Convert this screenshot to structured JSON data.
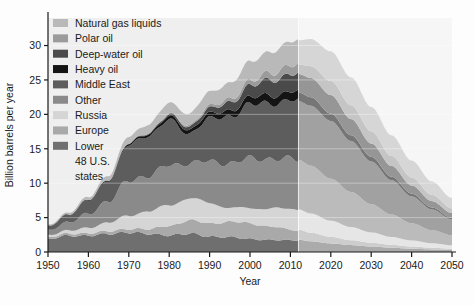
{
  "chart_data": {
    "type": "area",
    "stacked": true,
    "title": "",
    "xlabel": "Year",
    "ylabel": "Billion barrels per year",
    "xlim": [
      1950,
      2050
    ],
    "ylim": [
      0,
      34
    ],
    "xticks": [
      1950,
      1960,
      1970,
      1980,
      1990,
      2000,
      2010,
      2020,
      2030,
      2040,
      2050
    ],
    "yticks": [
      0,
      5,
      10,
      15,
      20,
      25,
      30
    ],
    "grid": "horizontal-light",
    "legend_position": "top-left-inside",
    "projection_start_year": 2012,
    "projection_shading": "#f0f0f0",
    "plot_background": "#efefef",
    "x": [
      1950,
      1955,
      1960,
      1965,
      1970,
      1975,
      1980,
      1985,
      1990,
      1995,
      2000,
      2005,
      2010,
      2012,
      2015,
      2020,
      2025,
      2030,
      2035,
      2040,
      2045,
      2050
    ],
    "series": [
      {
        "name": "Lower 48 U.S. states",
        "color": "#6f6f6f",
        "values": [
          1.95,
          2.3,
          2.45,
          2.55,
          2.95,
          2.55,
          2.5,
          2.6,
          2.3,
          2.1,
          1.95,
          1.7,
          1.75,
          1.8,
          1.55,
          1.25,
          1.0,
          0.8,
          0.62,
          0.48,
          0.38,
          0.3
        ]
      },
      {
        "name": "Europe",
        "color": "#a9a9a9",
        "values": [
          0.25,
          0.3,
          0.35,
          0.4,
          0.5,
          0.7,
          1.4,
          1.9,
          1.95,
          2.2,
          2.3,
          1.95,
          1.55,
          1.45,
          1.25,
          0.95,
          0.72,
          0.55,
          0.42,
          0.32,
          0.24,
          0.18
        ]
      },
      {
        "name": "Russia",
        "color": "#d5d5d5",
        "values": [
          0.3,
          0.45,
          0.8,
          1.25,
          1.95,
          2.6,
          3.0,
          3.25,
          2.95,
          2.05,
          2.15,
          2.7,
          2.9,
          2.95,
          2.8,
          2.35,
          1.9,
          1.5,
          1.15,
          0.88,
          0.66,
          0.5
        ]
      },
      {
        "name": "Other",
        "color": "#8a8a8a",
        "values": [
          0.7,
          1.2,
          2.0,
          3.2,
          5.0,
          5.3,
          5.7,
          5.2,
          5.9,
          6.6,
          7.1,
          7.3,
          7.2,
          7.2,
          6.95,
          6.1,
          5.1,
          4.1,
          3.25,
          2.5,
          1.9,
          1.45
        ]
      },
      {
        "name": "Middle East",
        "color": "#5d5d5d",
        "values": [
          0.55,
          1.1,
          1.9,
          3.1,
          5.1,
          6.0,
          6.4,
          4.4,
          6.1,
          6.9,
          7.7,
          8.2,
          8.4,
          8.5,
          8.7,
          8.4,
          7.4,
          6.2,
          5.0,
          3.9,
          3.0,
          2.3
        ]
      },
      {
        "name": "Heavy oil",
        "color": "#141414",
        "values": [
          0.05,
          0.07,
          0.1,
          0.14,
          0.22,
          0.32,
          0.48,
          0.55,
          0.7,
          0.85,
          1.0,
          1.15,
          1.25,
          1.3,
          1.25,
          1.05,
          0.85,
          0.68,
          0.52,
          0.4,
          0.3,
          0.22
        ]
      },
      {
        "name": "Deep-water oil",
        "color": "#4a4a4a",
        "values": [
          0.0,
          0.0,
          0.0,
          0.02,
          0.05,
          0.12,
          0.28,
          0.45,
          0.75,
          1.15,
          1.7,
          2.2,
          2.55,
          2.65,
          2.8,
          2.7,
          2.35,
          1.95,
          1.55,
          1.2,
          0.92,
          0.7
        ]
      },
      {
        "name": "Polar oil",
        "color": "#9b9b9b",
        "values": [
          0.0,
          0.0,
          0.0,
          0.0,
          0.02,
          0.05,
          0.12,
          0.22,
          0.35,
          0.5,
          0.72,
          1.0,
          1.3,
          1.4,
          1.7,
          2.05,
          2.0,
          1.75,
          1.45,
          1.15,
          0.9,
          0.7
        ]
      },
      {
        "name": "Natural gas liquids",
        "color": "#b9b9b9",
        "values": [
          0.15,
          0.25,
          0.4,
          0.6,
          0.95,
          1.2,
          1.55,
          1.7,
          2.0,
          2.35,
          2.75,
          3.1,
          3.4,
          3.5,
          3.95,
          4.3,
          4.05,
          3.55,
          3.0,
          2.45,
          1.95,
          1.5
        ]
      }
    ]
  },
  "legend": {
    "items": [
      {
        "label": "Natural gas liquids",
        "color": "#b9b9b9"
      },
      {
        "label": "Polar oil",
        "color": "#9b9b9b"
      },
      {
        "label": "Deep-water oil",
        "color": "#4a4a4a"
      },
      {
        "label": "Heavy oil",
        "color": "#141414"
      },
      {
        "label": "Middle East",
        "color": "#5d5d5d"
      },
      {
        "label": "Other",
        "color": "#8a8a8a"
      },
      {
        "label": "Russia",
        "color": "#d5d5d5"
      },
      {
        "label": "Europe",
        "color": "#a9a9a9"
      },
      {
        "label": "Lower",
        "color": "#6f6f6f"
      },
      {
        "label": "48 U.S.",
        "color": null
      },
      {
        "label": "states",
        "color": null
      }
    ]
  },
  "axes": {
    "y_title": "Billion barrels per year",
    "x_title": "Year",
    "y_tick_labels": [
      "0",
      "5",
      "10",
      "15",
      "20",
      "25",
      "30"
    ],
    "x_tick_labels": [
      "1950",
      "1960",
      "1970",
      "1980",
      "1990",
      "2000",
      "2010",
      "2020",
      "2030",
      "2040",
      "2050"
    ]
  }
}
